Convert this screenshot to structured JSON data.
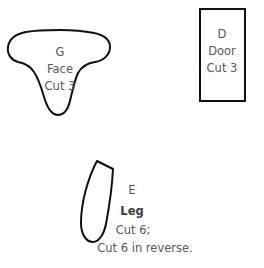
{
  "document": {
    "title": "Sewing pattern piece sheet",
    "background_color": "#ffffff",
    "outline_color": "#000000",
    "text_color": "#58595b"
  },
  "pieces": [
    {
      "id": "face",
      "letter": "G",
      "name": "Face",
      "cut_instruction": "Cut 3",
      "shape": "three-lobed-blob"
    },
    {
      "id": "door",
      "letter": "D",
      "name": "Door",
      "cut_instruction": "Cut 3",
      "shape": "rectangle"
    },
    {
      "id": "leg",
      "letter": "E",
      "name": "Leg",
      "cut_instruction": "Cut 6;",
      "cut_instruction_2": "Cut 6 in reverse.",
      "shape": "curved-strip"
    }
  ]
}
